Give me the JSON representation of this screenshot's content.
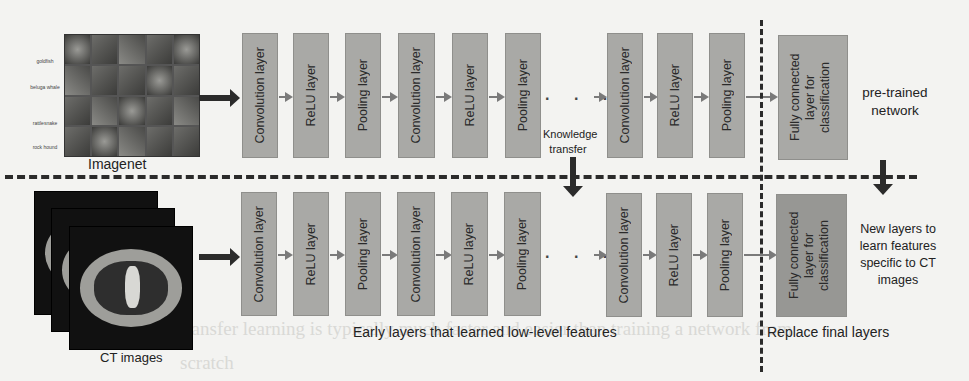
{
  "background_text": [
    "transfer learning is typically much faster and easier than training a network from",
    "scratch"
  ],
  "inputs": {
    "imagenet": {
      "label": "Imagenet",
      "row_labels": [
        "goldfish",
        "beluga whale",
        "rattlesnake",
        "rock hound"
      ]
    },
    "ct": {
      "label": "CT images"
    }
  },
  "top_row": {
    "layers": [
      {
        "label": "Convolution layer"
      },
      {
        "label": "ReLU layer"
      },
      {
        "label": "Pooling layer"
      },
      {
        "label": "Convolution layer"
      },
      {
        "label": "ReLU layer"
      },
      {
        "label": "Pooling layer"
      },
      {
        "label": "Convolution layer"
      },
      {
        "label": "ReLU layer"
      },
      {
        "label": "Pooling layer"
      }
    ],
    "fc_label": "Fully connected layer for classification",
    "side_label": "pre-trained network"
  },
  "bottom_row": {
    "layers": [
      {
        "label": "Convolution layer"
      },
      {
        "label": "ReLU layer"
      },
      {
        "label": "Pooling layer"
      },
      {
        "label": "Convolution layer"
      },
      {
        "label": "ReLU layer"
      },
      {
        "label": "Pooling layer"
      },
      {
        "label": "Convolution layer"
      },
      {
        "label": "ReLU layer"
      },
      {
        "label": "Pooling layer"
      }
    ],
    "fc_label": "Fully connected layer for classification",
    "side_label": "New layers to learn features specific to CT images"
  },
  "annotations": {
    "knowledge_transfer": "Knowledge transfer",
    "early_layers": "Early layers that learned low-level features",
    "replace_final": "Replace final layers",
    "ellipsis": ". . ."
  }
}
